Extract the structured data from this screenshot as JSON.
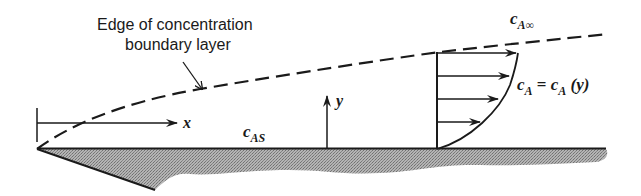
{
  "labels": {
    "edge_line1": "Edge of concentration",
    "edge_line2": "boundary layer",
    "c_inf_base": "c",
    "c_inf_sub": "A∞",
    "c_surface_base": "c",
    "c_surface_sub": "AS",
    "profile_lhs_base": "c",
    "profile_lhs_sub": "A",
    "profile_eq": " = ",
    "profile_rhs_base": "c",
    "profile_rhs_sub": "A",
    "profile_rhs_arg": " (y)",
    "x_axis": "x",
    "y_axis": "y"
  },
  "colors": {
    "ink": "#1a1a1a",
    "plate_fill": "#9a9a9a"
  }
}
